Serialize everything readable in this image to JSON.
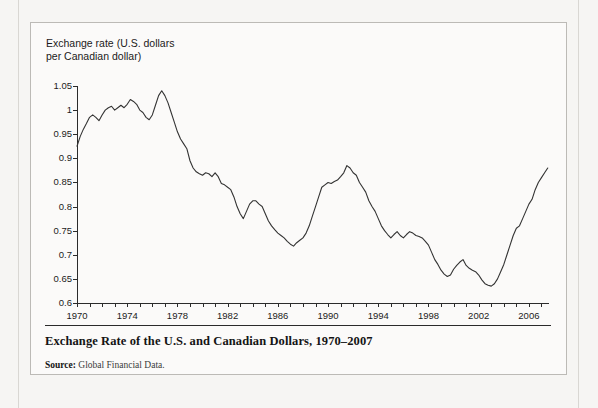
{
  "figure": {
    "axis_title": "Exchange rate (U.S. dollars\nper Canadian dollar)",
    "caption_title": "Exchange Rate of the U.S. and Canadian Dollars, 1970–2007",
    "source_label": "Source:",
    "source_text": " Global Financial Data."
  },
  "chart_data": {
    "type": "line",
    "title": "Exchange Rate of the U.S. and Canadian Dollars, 1970–2007",
    "xlabel": "",
    "ylabel": "Exchange rate (U.S. dollars per Canadian dollar)",
    "xlim": [
      1970,
      2007.6
    ],
    "ylim": [
      0.6,
      1.05
    ],
    "grid": false,
    "legend": "none",
    "line_color": "#333333",
    "y_ticks": [
      0.6,
      0.65,
      0.7,
      0.75,
      0.8,
      0.85,
      0.9,
      0.95,
      1,
      1.05
    ],
    "y_tick_labels": [
      "0.6",
      "0.65",
      "0.7",
      "0.75",
      "0.8",
      "0.85",
      "0.9",
      "0.95",
      "1",
      "1.05"
    ],
    "x_tick_interval": 1,
    "x_tick_labels": [
      "1970",
      "1974",
      "1978",
      "1982",
      "1986",
      "1990",
      "1994",
      "1998",
      "2002",
      "2006"
    ],
    "x_tick_label_values": [
      1970,
      1974,
      1978,
      1982,
      1986,
      1990,
      1994,
      1998,
      2002,
      2006
    ],
    "x": [
      1970.0,
      1970.25,
      1970.5,
      1970.75,
      1971.0,
      1971.25,
      1971.5,
      1971.75,
      1972.0,
      1972.25,
      1972.5,
      1972.75,
      1973.0,
      1973.25,
      1973.5,
      1973.75,
      1974.0,
      1974.25,
      1974.5,
      1974.75,
      1975.0,
      1975.25,
      1975.5,
      1975.75,
      1976.0,
      1976.25,
      1976.5,
      1976.75,
      1977.0,
      1977.25,
      1977.5,
      1977.75,
      1978.0,
      1978.25,
      1978.5,
      1978.75,
      1979.0,
      1979.25,
      1979.5,
      1979.75,
      1980.0,
      1980.25,
      1980.5,
      1980.75,
      1981.0,
      1981.25,
      1981.5,
      1981.75,
      1982.0,
      1982.25,
      1982.5,
      1982.75,
      1983.0,
      1983.25,
      1983.5,
      1983.75,
      1984.0,
      1984.25,
      1984.5,
      1984.75,
      1985.0,
      1985.25,
      1985.5,
      1985.75,
      1986.0,
      1986.25,
      1986.5,
      1986.75,
      1987.0,
      1987.25,
      1987.5,
      1987.75,
      1988.0,
      1988.25,
      1988.5,
      1988.75,
      1989.0,
      1989.25,
      1989.5,
      1989.75,
      1990.0,
      1990.25,
      1990.5,
      1990.75,
      1991.0,
      1991.25,
      1991.5,
      1991.75,
      1992.0,
      1992.25,
      1992.5,
      1992.75,
      1993.0,
      1993.25,
      1993.5,
      1993.75,
      1994.0,
      1994.25,
      1994.5,
      1994.75,
      1995.0,
      1995.25,
      1995.5,
      1995.75,
      1996.0,
      1996.25,
      1996.5,
      1996.75,
      1997.0,
      1997.25,
      1997.5,
      1997.75,
      1998.0,
      1998.25,
      1998.5,
      1998.75,
      1999.0,
      1999.25,
      1999.5,
      1999.75,
      2000.0,
      2000.25,
      2000.5,
      2000.75,
      2001.0,
      2001.25,
      2001.5,
      2001.75,
      2002.0,
      2002.25,
      2002.5,
      2002.75,
      2003.0,
      2003.25,
      2003.5,
      2003.75,
      2004.0,
      2004.25,
      2004.5,
      2004.75,
      2005.0,
      2005.25,
      2005.5,
      2005.75,
      2006.0,
      2006.25,
      2006.5,
      2006.75,
      2007.0,
      2007.25,
      2007.5
    ],
    "y": [
      0.925,
      0.945,
      0.96,
      0.972,
      0.985,
      0.99,
      0.985,
      0.978,
      0.99,
      1.0,
      1.005,
      1.008,
      1.0,
      1.005,
      1.01,
      1.005,
      1.012,
      1.022,
      1.018,
      1.012,
      1.0,
      0.995,
      0.985,
      0.98,
      0.99,
      1.01,
      1.03,
      1.04,
      1.03,
      1.015,
      0.995,
      0.975,
      0.955,
      0.94,
      0.93,
      0.92,
      0.895,
      0.88,
      0.872,
      0.868,
      0.865,
      0.87,
      0.868,
      0.862,
      0.87,
      0.862,
      0.848,
      0.845,
      0.84,
      0.835,
      0.82,
      0.8,
      0.785,
      0.775,
      0.79,
      0.805,
      0.812,
      0.812,
      0.805,
      0.8,
      0.785,
      0.77,
      0.76,
      0.752,
      0.745,
      0.74,
      0.735,
      0.728,
      0.722,
      0.718,
      0.725,
      0.73,
      0.735,
      0.745,
      0.76,
      0.78,
      0.8,
      0.82,
      0.84,
      0.845,
      0.85,
      0.848,
      0.852,
      0.855,
      0.862,
      0.87,
      0.885,
      0.88,
      0.87,
      0.865,
      0.85,
      0.84,
      0.83,
      0.812,
      0.8,
      0.79,
      0.775,
      0.76,
      0.75,
      0.742,
      0.735,
      0.742,
      0.748,
      0.74,
      0.735,
      0.742,
      0.748,
      0.745,
      0.74,
      0.738,
      0.735,
      0.728,
      0.72,
      0.705,
      0.69,
      0.68,
      0.668,
      0.66,
      0.655,
      0.658,
      0.67,
      0.678,
      0.685,
      0.69,
      0.678,
      0.672,
      0.668,
      0.665,
      0.658,
      0.648,
      0.64,
      0.637,
      0.635,
      0.64,
      0.65,
      0.665,
      0.68,
      0.7,
      0.72,
      0.74,
      0.755,
      0.76,
      0.775,
      0.79,
      0.805,
      0.815,
      0.835,
      0.85,
      0.86,
      0.87,
      0.88,
      0.89,
      0.9,
      0.92,
      1.02
    ]
  }
}
